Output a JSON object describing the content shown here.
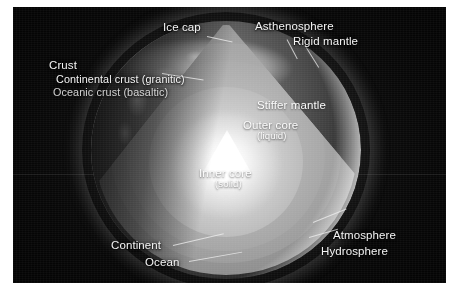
{
  "figure": {
    "background_color": "#060606",
    "text_color": "#f4f4f4"
  },
  "labels": {
    "ice_cap": "Ice cap",
    "asthenosphere": "Asthenosphere",
    "rigid_mantle": "Rigid mantle",
    "crust": "Crust",
    "continental_crust": "Continental crust (granitic)",
    "oceanic_crust": "Oceanic crust (basaltic)",
    "stiffer_mantle": "Stiffer mantle",
    "outer_core": "Outer core",
    "outer_core_state": "(liquid)",
    "inner_core": "Inner core",
    "inner_core_state": "(solid)",
    "continent": "Continent",
    "ocean": "Ocean",
    "atmosphere": "Atmosphere",
    "hydrosphere": "Hydrosphere"
  },
  "layers": [
    {
      "name": "Crust",
      "detail": "Continental crust (granitic); Oceanic crust (basaltic)"
    },
    {
      "name": "Rigid mantle",
      "detail": ""
    },
    {
      "name": "Asthenosphere",
      "detail": ""
    },
    {
      "name": "Stiffer mantle",
      "detail": ""
    },
    {
      "name": "Outer core",
      "detail": "liquid"
    },
    {
      "name": "Inner core",
      "detail": "solid"
    }
  ],
  "surface_features": [
    "Ice cap",
    "Continent",
    "Ocean",
    "Atmosphere",
    "Hydrosphere"
  ]
}
